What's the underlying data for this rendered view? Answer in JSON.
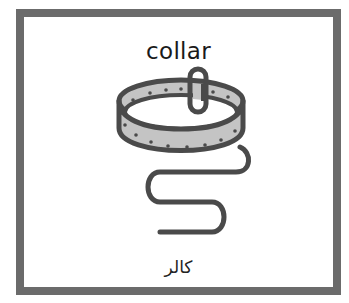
{
  "card": {
    "title": "collar",
    "subtitle": "کالر",
    "symbol": "dog-collar-with-leash",
    "colors": {
      "border": "#6b6b6b",
      "outline": "#4a4a4a",
      "fill": "#c4c4c4",
      "background": "#ffffff"
    }
  }
}
